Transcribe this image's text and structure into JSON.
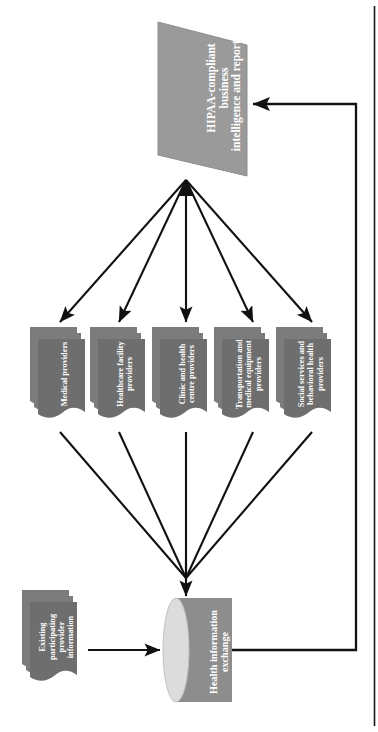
{
  "diagram": {
    "orientation": "rotated-90",
    "colors": {
      "parallelogram_fill": "#9a9a9a",
      "document_fill": "#6e6e6e",
      "document_stack_fill": "#7c7c7c",
      "cylinder_body_fill": "#8d8d8d",
      "cylinder_cap_fill": "#dcdcdc",
      "arrow_stroke": "#111111",
      "label_text": "#ffffff",
      "border_line": "#1a1a1a",
      "page_background": "#ffffff"
    },
    "nodes": {
      "output": {
        "shape": "parallelogram",
        "label": "HIPAA-compliant business\nintelligence and reporting"
      },
      "datastore": {
        "shape": "cylinder",
        "label": "Health information\nexchange"
      },
      "existing": {
        "shape": "document-stack",
        "label": "Existing participating\nprovider information"
      }
    },
    "providers": [
      {
        "shape": "document-stack",
        "label": "Medical providers"
      },
      {
        "shape": "document-stack",
        "label": "Healthcare facility\nproviders"
      },
      {
        "shape": "document-stack",
        "label": "Clinic and health\ncentre providers"
      },
      {
        "shape": "document-stack",
        "label": "Transportation and\nmedical equipment\nproviders"
      },
      {
        "shape": "document-stack",
        "label": "Social services and\nbehavioral health\nproviders"
      }
    ],
    "connectors": [
      {
        "name": "output-to-providers-fan",
        "from": "output",
        "to": "providers",
        "style": "solid",
        "arrowhead": "both-ends-fan"
      },
      {
        "name": "providers-to-datastore-fan",
        "from": "providers",
        "to": "datastore",
        "style": "solid",
        "arrowhead": "converging"
      },
      {
        "name": "existing-to-datastore",
        "from": "existing",
        "to": "datastore",
        "style": "solid",
        "arrowhead": "single"
      },
      {
        "name": "datastore-to-output-feedback",
        "from": "datastore",
        "to": "output",
        "style": "solid-elbow",
        "arrowhead": "single"
      }
    ]
  }
}
